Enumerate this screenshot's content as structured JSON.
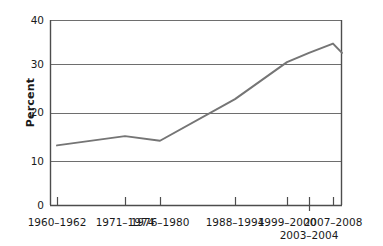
{
  "chart_data": {
    "type": "line",
    "title": "",
    "subtitle": "",
    "xlabel": "",
    "ylabel": "Percent",
    "ylim": [
      0,
      40
    ],
    "yticks": [
      0,
      10,
      20,
      30,
      40
    ],
    "ytick_labels": [
      "0",
      "10",
      "20",
      "30",
      "40"
    ],
    "grid": "horizontal",
    "legend": "none",
    "line_color": "#757575",
    "axis_color": "#4d4d4d",
    "categories": [
      "1960–1962",
      "1971–1974",
      "1976–1980",
      "1988–1994",
      "1999–2000",
      "2003–2004",
      "2007–2008"
    ],
    "category_labels_row2": [
      "",
      "",
      "",
      "",
      "",
      "2003–2004",
      ""
    ],
    "x_positions_px": [
      57,
      125,
      160,
      235,
      287,
      309,
      333
    ],
    "values": [
      13,
      15,
      14,
      23,
      31,
      33,
      35
    ],
    "end_value": 33,
    "end_x_px": 342
  },
  "axis": {
    "y_title": "Percent",
    "y_labels": [
      "40",
      "30",
      "20",
      "10",
      "0"
    ],
    "x_labels_top": [
      "1960–1962",
      "1971–1974",
      "1976–1980",
      "1988–1994",
      "1999–2000",
      "2007–2008"
    ],
    "x_labels_bottom": [
      "2003–2004"
    ]
  }
}
